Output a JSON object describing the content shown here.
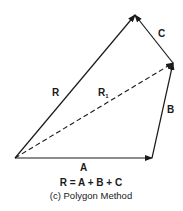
{
  "diagram": {
    "vectors": {
      "A": {
        "label": "A",
        "from": [
          15,
          158
        ],
        "to": [
          152,
          158
        ],
        "style": "solid"
      },
      "B": {
        "label": "B",
        "from": [
          152,
          158
        ],
        "to": [
          173,
          63
        ],
        "style": "solid"
      },
      "C": {
        "label": "C",
        "from": [
          173,
          63
        ],
        "to": [
          135,
          15
        ],
        "style": "solid"
      },
      "R": {
        "label": "R",
        "from": [
          15,
          158
        ],
        "to": [
          135,
          15
        ],
        "style": "solid"
      },
      "R1": {
        "label": "R",
        "subscript": "1",
        "from": [
          15,
          158
        ],
        "to": [
          173,
          63
        ],
        "style": "dashed"
      }
    },
    "equation": "R = A + B + C",
    "caption": "(c) Polygon Method",
    "line_color": "#1a1a1a"
  }
}
